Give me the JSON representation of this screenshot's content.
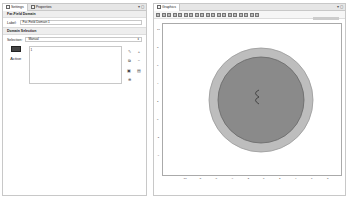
{
  "left_panel": {
    "tabs": [
      {
        "label": "Settings",
        "icon": "settings-icon"
      },
      {
        "label": "Properties",
        "icon": "properties-icon"
      }
    ],
    "window_controls": "▾ ◻",
    "title": "Far-Field Domain",
    "label_field": {
      "label": "Label:",
      "value": "Far-Field Domain 1"
    },
    "section_domain_selection": "Domain Selection",
    "selection": {
      "label": "Selection:",
      "value": "Manual"
    },
    "active_label": "Active",
    "list_items": [
      "1"
    ],
    "tool_icons": [
      "pencil-icon",
      "plus-icon",
      "copy-icon",
      "minus-icon",
      "paste-icon",
      "clear-icon",
      "zoom-selection-icon"
    ]
  },
  "graphics_panel": {
    "tab_label": "Graphics",
    "window_controls": "▾ ◻",
    "y_ticks": [
      "10",
      "8",
      "6",
      "4",
      "2",
      "0",
      "-2",
      "-4",
      "-6",
      "-8"
    ],
    "x_ticks": [
      "-10",
      "-8",
      "-6",
      "-4",
      "-2",
      "0",
      "2",
      "4",
      "6",
      "8",
      "10"
    ],
    "axis_unit": "m",
    "colors": {
      "outer": "#bdbdbd",
      "inner": "#8a8a8a",
      "outline": "#555555"
    }
  }
}
